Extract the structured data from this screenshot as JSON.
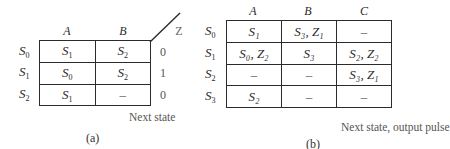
{
  "table_a": {
    "columns": [
      "A",
      "B"
    ],
    "output_header": "Z",
    "rows": [
      {
        "state": "S",
        "sub": "0",
        "cells": [
          {
            "s": "S",
            "sub": "1"
          },
          {
            "s": "S",
            "sub": "2"
          }
        ],
        "z": "0"
      },
      {
        "state": "S",
        "sub": "1",
        "cells": [
          {
            "s": "S",
            "sub": "0"
          },
          {
            "s": "S",
            "sub": "2"
          }
        ],
        "z": "1"
      },
      {
        "state": "S",
        "sub": "2",
        "cells": [
          {
            "s": "S",
            "sub": "1"
          },
          {
            "s": "–"
          }
        ],
        "z": "0"
      }
    ],
    "caption": "Next state",
    "label": "(a)"
  },
  "table_b": {
    "columns": [
      "A",
      "B",
      "C"
    ],
    "rows": [
      {
        "state": "S",
        "sub": "0",
        "cells": [
          "S₁",
          "S₃, Z₁",
          "–"
        ]
      },
      {
        "state": "S",
        "sub": "1",
        "cells": [
          "S₀, Z₂",
          "S₃",
          "S₂, Z₂"
        ]
      },
      {
        "state": "S",
        "sub": "2",
        "cells": [
          "–",
          "–",
          "S₃, Z₁"
        ]
      },
      {
        "state": "S",
        "sub": "3",
        "cells": [
          "S₂",
          "–",
          "–"
        ]
      }
    ],
    "caption": "Next state, output pulse",
    "label": "(b)"
  }
}
